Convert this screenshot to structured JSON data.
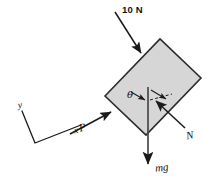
{
  "figure": {
    "background_color": "#ffffff",
    "stroke_color": "#1a1a1a",
    "block_fill_color": "#d6d6d6",
    "block_stroke_color": "#2b2b2b"
  },
  "labels": {
    "applied_load": "10 N",
    "push_force": "P",
    "normal_force": "N",
    "weight": "mg",
    "angle": "θ",
    "axis_x": "x",
    "axis_y": "y"
  },
  "diagram_data": {
    "type": "free-body-diagram",
    "body": {
      "name": "block",
      "shape": "rectangle",
      "tilt_degrees": -18,
      "corners": [
        {
          "x": 105,
          "y": 96
        },
        {
          "x": 160,
          "y": 39
        },
        {
          "x": 201,
          "y": 78
        },
        {
          "x": 146,
          "y": 135
        }
      ]
    },
    "forces": [
      {
        "name": "applied_load",
        "label": "10 N",
        "magnitude": 10,
        "unit": "N",
        "direction": "down-right into top face",
        "tail": {
          "x": 115,
          "y": 12
        },
        "head": {
          "x": 143,
          "y": 56
        }
      },
      {
        "name": "push_force",
        "label": "P",
        "direction": "up-right toward lower-left face",
        "tail": {
          "x": 71,
          "y": 133
        },
        "head": {
          "x": 113,
          "y": 111
        }
      },
      {
        "name": "normal_force",
        "label": "N",
        "direction": "up-left perpendicular to lower face",
        "tail": {
          "x": 184,
          "y": 127
        },
        "head": {
          "x": 154,
          "y": 99
        }
      },
      {
        "name": "weight",
        "label": "mg",
        "direction": "vertically downward",
        "tail": {
          "x": 148,
          "y": 88
        },
        "head": {
          "x": 148,
          "y": 167
        }
      }
    ],
    "angle_marks": [
      {
        "name": "theta",
        "label": "θ",
        "between": [
          "block lower face",
          "vertical reference line"
        ]
      }
    ],
    "axes": {
      "origin": {
        "x": 35,
        "y": 143
      },
      "x_end": {
        "x": 82,
        "y": 124
      },
      "y_end": {
        "x": 22,
        "y": 110
      },
      "x_label": "x",
      "y_label": "y",
      "tilted": true
    }
  }
}
